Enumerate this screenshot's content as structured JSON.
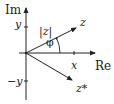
{
  "diagram": {
    "axes": {
      "imaginary_label": "Im",
      "real_label": "Re"
    },
    "ticks": {
      "y_label": "y",
      "neg_y_label": "−y",
      "x_label": "x"
    },
    "vectors": {
      "z_label": "z",
      "conjugate_label": "z*",
      "modulus_label": "|z|",
      "angle_label": "φ"
    },
    "colors": {
      "ink": "#222222",
      "background": "#ffffff"
    }
  }
}
